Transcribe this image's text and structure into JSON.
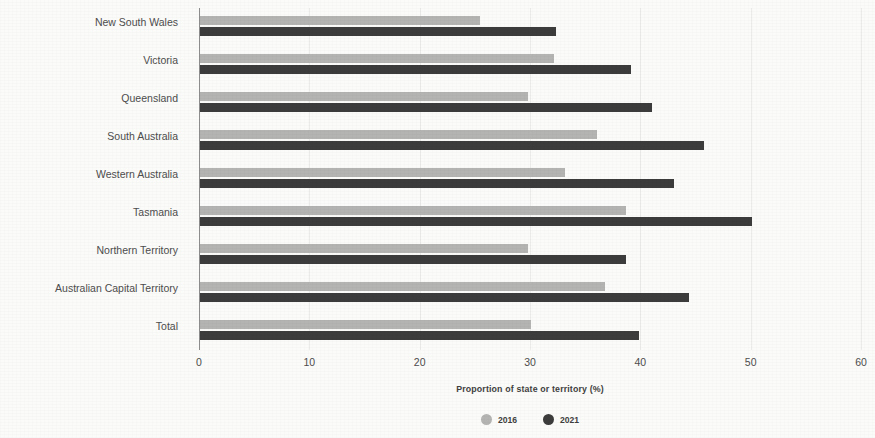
{
  "chart_data": {
    "type": "bar",
    "orientation": "horizontal",
    "title": "",
    "xlabel": "Proportion of state or territory (%)",
    "ylabel": "State/territory",
    "xlim": [
      0,
      60
    ],
    "xticks": [
      0,
      10,
      20,
      30,
      40,
      50,
      60
    ],
    "xtick_labels": [
      "0",
      "10",
      "20",
      "30",
      "40",
      "50",
      "60"
    ],
    "grid": true,
    "legend_position": "bottom",
    "categories": [
      "New South Wales",
      "Victoria",
      "Queensland",
      "South Australia",
      "Western Australia",
      "Tasmania",
      "Northern Territory",
      "Australian Capital Territory",
      "Total"
    ],
    "series": [
      {
        "name": "2016",
        "color": "#b4b4b2",
        "values": [
          25.4,
          32.1,
          29.7,
          36.0,
          33.1,
          38.6,
          29.7,
          36.7,
          30.0
        ]
      },
      {
        "name": "2021",
        "color": "#3c3c3c",
        "values": [
          32.3,
          39.1,
          41.0,
          45.7,
          43.0,
          50.0,
          38.6,
          44.3,
          39.8
        ]
      }
    ]
  },
  "legend": {
    "items": [
      {
        "label": "2016",
        "swatch": "circle-swatch-2016"
      },
      {
        "label": "2021",
        "swatch": "circle-swatch-2021"
      }
    ]
  }
}
